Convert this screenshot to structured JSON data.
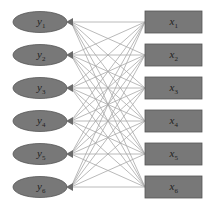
{
  "diagram": {
    "type": "bipartite-fully-connected",
    "left_nodes": [
      {
        "var": "y",
        "sub": "1",
        "cy": 22
      },
      {
        "var": "y",
        "sub": "2",
        "cy": 55
      },
      {
        "var": "y",
        "sub": "3",
        "cy": 88
      },
      {
        "var": "y",
        "sub": "4",
        "cy": 121
      },
      {
        "var": "y",
        "sub": "5",
        "cy": 154
      },
      {
        "var": "y",
        "sub": "6",
        "cy": 187
      }
    ],
    "right_nodes": [
      {
        "var": "x",
        "sub": "1",
        "cy": 22
      },
      {
        "var": "x",
        "sub": "2",
        "cy": 55
      },
      {
        "var": "x",
        "sub": "3",
        "cy": 88
      },
      {
        "var": "x",
        "sub": "4",
        "cy": 121
      },
      {
        "var": "x",
        "sub": "5",
        "cy": 154
      },
      {
        "var": "x",
        "sub": "6",
        "cy": 187
      }
    ],
    "left_shape": "ellipse",
    "right_shape": "rectangle",
    "edge_direction": "right-to-left",
    "colors": {
      "node_fill": "#787878",
      "node_stroke": "#555555",
      "edge": "#a8a8a8",
      "arrow": "#6a6a6a"
    }
  }
}
